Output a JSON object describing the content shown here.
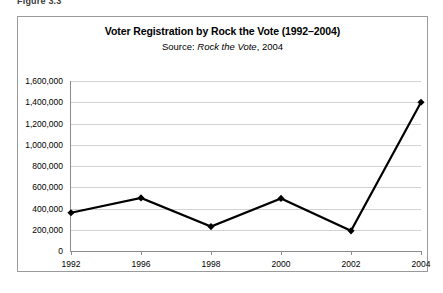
{
  "figure": {
    "caption": "Figure 3.3"
  },
  "chart": {
    "title": "Voter Registration by Rock the Vote (1992–2004)",
    "subtitle_prefix": "Source: ",
    "subtitle_source": "Rock the Vote",
    "subtitle_suffix": ", 2004"
  },
  "chart_data": {
    "type": "line",
    "title": "Voter Registration by Rock the Vote (1992–2004)",
    "subtitle": "Source: Rock the Vote, 2004",
    "xlabel": "",
    "ylabel": "",
    "categories": [
      "1992",
      "1996",
      "1998",
      "2000",
      "2002",
      "2004"
    ],
    "values": [
      360000,
      500000,
      230000,
      495000,
      190000,
      1400000
    ],
    "series": [
      {
        "name": "Voter Registration",
        "values": [
          360000,
          500000,
          230000,
          495000,
          190000,
          1400000
        ],
        "color": "#000000",
        "marker": "diamond",
        "line_width": 2.2
      }
    ],
    "ylim": [
      0,
      1600000
    ],
    "ytick_step": 200000,
    "ytick_labels": [
      "0",
      "200,000",
      "400,000",
      "600,000",
      "800,000",
      "1,000,000",
      "1,200,000",
      "1,400,000",
      "1,600,000"
    ],
    "ytick_values": [
      0,
      200000,
      400000,
      600000,
      800000,
      1000000,
      1200000,
      1400000,
      1600000
    ],
    "xtick_labels": [
      "1992",
      "1996",
      "1998",
      "2000",
      "2002",
      "2004"
    ],
    "grid": {
      "horizontal": true,
      "vertical": false,
      "color": "#d2d2d2"
    },
    "legend": {
      "visible": false,
      "position": "none"
    },
    "axis_color": "#8c8c8c",
    "background": "#ffffff",
    "border_color": "#9a9a9a"
  }
}
